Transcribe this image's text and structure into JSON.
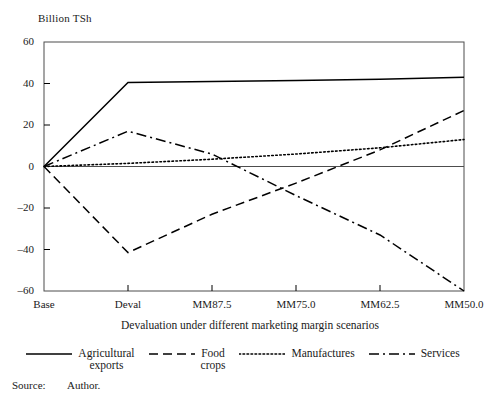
{
  "chart_data": {
    "type": "line",
    "title": "",
    "ylabel": "Billion TSh",
    "xlabel": "Devaluation under different marketing margin scenarios",
    "categories": [
      "Base",
      "Deval",
      "MM87.5",
      "MM75.0",
      "MM62.5",
      "MM50.0"
    ],
    "ylim": [
      -60,
      60
    ],
    "yticks": [
      60,
      40,
      20,
      0,
      -20,
      -40,
      -60
    ],
    "ytick_labels": [
      "60",
      "40",
      "20",
      "0",
      "–20",
      "–40",
      "–60"
    ],
    "grid": false,
    "legend_position": "bottom",
    "series": [
      {
        "name": "Agricultural\nexports",
        "style": "solid",
        "color": "#000000",
        "values": [
          0,
          40.5,
          41,
          41.5,
          42,
          43
        ]
      },
      {
        "name": "Food\ncrops",
        "style": "dashed",
        "color": "#000000",
        "values": [
          0,
          -41.5,
          -23,
          -8,
          8,
          27
        ]
      },
      {
        "name": "Manufactures",
        "style": "dotted",
        "color": "#000000",
        "values": [
          0,
          1.5,
          3.5,
          6,
          9,
          13
        ]
      },
      {
        "name": "Services",
        "style": "dash-dot",
        "color": "#000000",
        "values": [
          0,
          17,
          6,
          -14,
          -33,
          -60
        ]
      }
    ]
  },
  "axis": {
    "y_title": "Billion TSh",
    "x_caption": "Devaluation under different marketing margin scenarios"
  },
  "legend": [
    {
      "label": "Agricultural\nexports",
      "style": "solid"
    },
    {
      "label": "Food\ncrops",
      "style": "dashed"
    },
    {
      "label": "Manufactures",
      "style": "dotted"
    },
    {
      "label": "Services",
      "style": "dash-dot"
    }
  ],
  "source": {
    "label": "Source:",
    "value": "Author."
  },
  "colors": {
    "ink": "#000000",
    "axis": "#4d4d4d",
    "background": "#ffffff"
  }
}
